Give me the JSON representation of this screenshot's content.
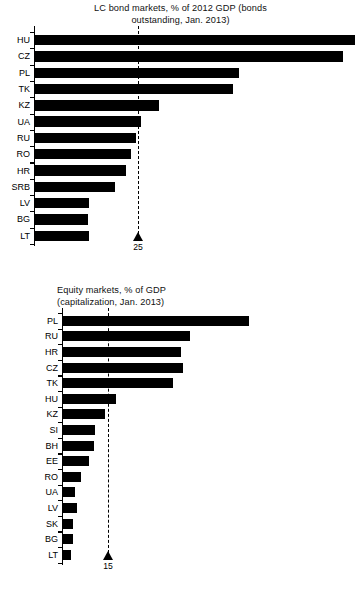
{
  "chart_data": [
    {
      "id": "bonds",
      "type": "bar",
      "orientation": "horizontal",
      "title": "LC bond markets, % of 2012 GDP (bonds\noutstanding, Jan. 2013)",
      "xlabel": "",
      "ylabel": "",
      "grid": false,
      "legend": null,
      "xlim": [
        0,
        80
      ],
      "categories": [
        "HU",
        "CZ",
        "PL",
        "TK",
        "KZ",
        "UA",
        "RU",
        "RO",
        "HR",
        "SRB",
        "LV",
        "BG",
        "LT"
      ],
      "values": [
        77.0,
        74.0,
        49.0,
        47.5,
        29.8,
        25.5,
        24.3,
        23.1,
        21.9,
        19.2,
        13.0,
        12.7,
        13.0
      ],
      "reference_line": {
        "value": 25,
        "label": "25",
        "style": "dashed",
        "marker": "triangle-up"
      }
    },
    {
      "id": "equity",
      "type": "bar",
      "orientation": "horizontal",
      "title": "Equity markets, % of GDP\n(capitalization, Jan. 2013)",
      "xlabel": "",
      "ylabel": "",
      "grid": false,
      "legend": null,
      "xlim": [
        0,
        65
      ],
      "categories": [
        "PL",
        "RU",
        "HR",
        "CZ",
        "TK",
        "HU",
        "KZ",
        "SI",
        "BH",
        "EE",
        "RO",
        "UA",
        "LV",
        "SK",
        "BG",
        "LT"
      ],
      "values": [
        60.5,
        41.5,
        38.5,
        39.0,
        35.8,
        17.2,
        13.6,
        10.4,
        10.1,
        8.5,
        5.9,
        4.0,
        4.6,
        3.3,
        3.3,
        2.6
      ],
      "reference_line": {
        "value": 15,
        "label": "15",
        "style": "dashed",
        "marker": "triangle-up"
      }
    }
  ]
}
